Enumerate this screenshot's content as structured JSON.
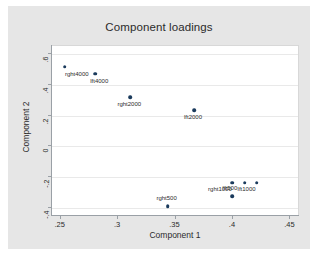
{
  "chart_data": {
    "type": "scatter",
    "title": "Component loadings",
    "xlabel": "Component 1",
    "ylabel": "Component 2",
    "xlim": [
      0.2425,
      0.4575
    ],
    "ylim": [
      -0.45,
      0.65
    ],
    "xticks": [
      ".25",
      ".3",
      ".35",
      ".4",
      ".45"
    ],
    "xtick_values": [
      0.25,
      0.3,
      0.35,
      0.4,
      0.45
    ],
    "yticks": [
      ".6",
      ".4",
      ".2",
      "0",
      "-.2",
      "-.4"
    ],
    "ytick_values": [
      0.6,
      0.4,
      0.2,
      0,
      -0.2,
      -0.4
    ],
    "grid": "horizontal",
    "legend": "none",
    "marker_color": "#1a3a5c",
    "points": [
      {
        "label": "rght4000",
        "x": 0.2545,
        "y": 0.515,
        "label_dx": 12,
        "label_dy": 4
      },
      {
        "label": "lft4000",
        "x": 0.281,
        "y": 0.4715,
        "label_dx": 4,
        "label_dy": 4
      },
      {
        "label": "rght2000",
        "x": 0.3115,
        "y": 0.3175,
        "label_dx": -1,
        "label_dy": 4
      },
      {
        "label": "lft2000",
        "x": 0.367,
        "y": 0.2335,
        "label_dx": -1,
        "label_dy": 4
      },
      {
        "label": "rght1000",
        "x": 0.4,
        "y": -0.2355,
        "label_dx": -12,
        "label_dy": 3
      },
      {
        "label": "lft1000",
        "x": 0.411,
        "y": -0.2355,
        "label_dx": 2,
        "label_dy": 3
      },
      {
        "label": "",
        "x": 0.4215,
        "y": -0.2355,
        "label_dx": 0,
        "label_dy": 0
      },
      {
        "label": "lft500",
        "x": 0.4,
        "y": -0.3225,
        "label_dx": -2,
        "label_dy": -11
      },
      {
        "label": "rght500",
        "x": 0.344,
        "y": -0.3855,
        "label_dx": -1,
        "label_dy": -11
      }
    ]
  }
}
